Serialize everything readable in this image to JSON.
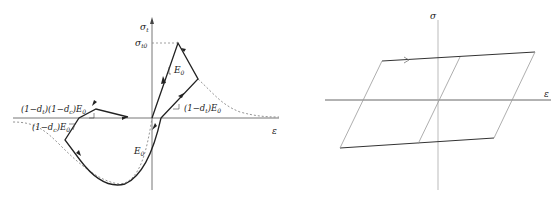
{
  "left_diagram": {
    "y_axis_label": "σ",
    "y_axis_subscript": "t",
    "peak_label": "σ",
    "peak_label_subscript": "t0",
    "tension_modulus_label": "E",
    "tension_modulus_subscript": "0",
    "tension_damaged_label": "(1−d",
    "tension_damaged_suffix": ")E",
    "tension_damaged_sub_d": "t",
    "tension_damaged_sub_E": "0",
    "combined_label": "(1−d",
    "combined_mid": ")(1−d",
    "combined_suffix": ")E",
    "combined_sub_d1": "t",
    "combined_sub_d2": "c",
    "combined_sub_E": "0",
    "compression_damaged_label": "(1−d",
    "compression_damaged_suffix": ")E",
    "compression_damaged_sub_d": "c",
    "compression_damaged_sub_E": "0",
    "compression_modulus_label": "E",
    "compression_modulus_subscript": "0",
    "x_axis_label": "ε"
  },
  "right_diagram": {
    "y_axis_label": "σ",
    "x_axis_label": "ε"
  }
}
